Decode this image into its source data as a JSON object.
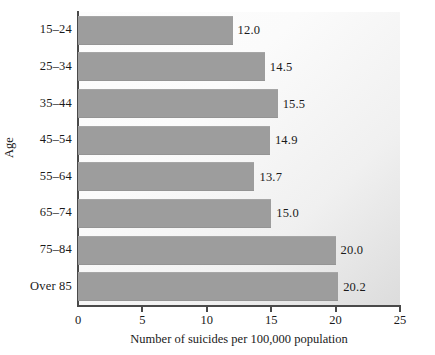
{
  "chart_data": {
    "type": "bar",
    "orientation": "horizontal",
    "title": "",
    "xlabel": "Number of suicides per 100,000 population",
    "ylabel": "Age",
    "categories": [
      "15–24",
      "25–34",
      "35–44",
      "45–54",
      "55–64",
      "65–74",
      "75–84",
      "Over 85"
    ],
    "values": [
      12.0,
      14.5,
      15.5,
      14.9,
      13.7,
      15.0,
      20.0,
      20.2
    ],
    "value_labels": [
      "12.0",
      "14.5",
      "15.5",
      "14.9",
      "13.7",
      "15.0",
      "20.0",
      "20.2"
    ],
    "xlim": [
      0,
      25
    ],
    "xticks": [
      0,
      5,
      10,
      15,
      20,
      25
    ],
    "xtick_labels": [
      "0",
      "5",
      "10",
      "15",
      "20",
      "25"
    ],
    "grid": false,
    "legend": null,
    "bar_color": "#9d9d9d",
    "axis_color": "#4a4a4a",
    "plot_background": "#fbfbfb"
  }
}
